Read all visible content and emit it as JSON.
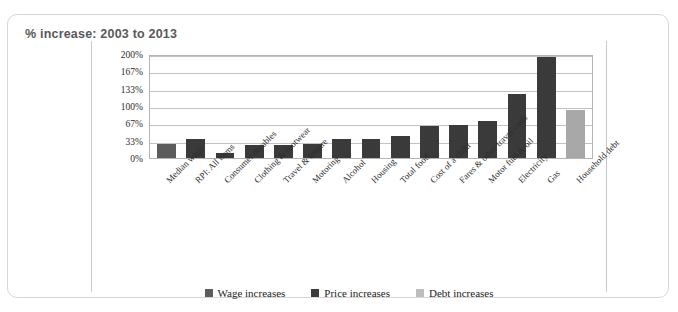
{
  "page": {
    "ghost_header": " "
  },
  "card": {
    "title": "% increase: 2003 to 2013"
  },
  "chart_data": {
    "type": "bar",
    "title": "% increase: 2003 to 2013",
    "xlabel": "",
    "ylabel": "",
    "ylim": [
      0,
      200
    ],
    "grid": true,
    "legend_position": "bottom",
    "ytick_labels": [
      "200%",
      "167%",
      "133%",
      "100%",
      "67%",
      "33%",
      "0%"
    ],
    "ytick_values": [
      200,
      167,
      133,
      100,
      67,
      33,
      0
    ],
    "categories": [
      "Median wage",
      "RPI: All items",
      "Consumer durables",
      "Clothing & footwear",
      "Travel & leisure",
      "Motoring",
      "Alcohol",
      "Housing",
      "Total food",
      "Cost of a child",
      "Fares & other travel costs",
      "Motor fuel & oil",
      "Electricity",
      "Gas",
      "Household debt"
    ],
    "values": [
      27,
      38,
      9,
      26,
      26,
      28,
      37,
      37,
      44,
      62,
      64,
      73,
      125,
      199,
      95
    ],
    "series_of_point": [
      "wage",
      "price",
      "price",
      "price",
      "price",
      "price",
      "price",
      "price",
      "price",
      "price",
      "price",
      "price",
      "price",
      "price",
      "debt"
    ],
    "series": [
      {
        "name": "Wage increases",
        "key": "wage",
        "color": "#5c5c5c"
      },
      {
        "name": "Price increases",
        "key": "price",
        "color": "#3a3a3a"
      },
      {
        "name": "Debt increases",
        "key": "debt",
        "color": "#bdbdbd"
      }
    ]
  },
  "legend": {
    "items": [
      {
        "label": "Wage increases",
        "key": "wage"
      },
      {
        "label": "Price increases",
        "key": "price"
      },
      {
        "label": "Debt increases",
        "key": "debt"
      }
    ]
  }
}
